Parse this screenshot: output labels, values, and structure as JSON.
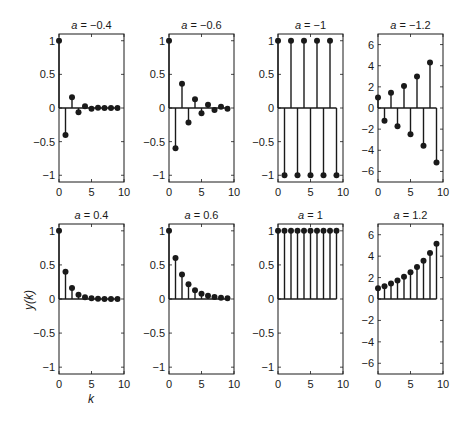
{
  "figure": {
    "ylabel": "y(k)",
    "xlabel": "k"
  },
  "chart_data": [
    {
      "type": "stem",
      "title": "a = −0.4",
      "a": -0.4,
      "x": [
        0,
        1,
        2,
        3,
        4,
        5,
        6,
        7,
        8,
        9
      ],
      "values": [
        1,
        -0.4,
        0.16,
        -0.064,
        0.0256,
        -0.01,
        0.004,
        -0.0016,
        0.0007,
        -0.0003
      ],
      "xlim": [
        0,
        10
      ],
      "ylim": [
        -1.1,
        1.1
      ],
      "xticks": [
        "0",
        "5",
        "10"
      ],
      "yticks": [
        "1",
        "0.5",
        "0",
        "−0.5",
        "−1"
      ]
    },
    {
      "type": "stem",
      "title": "a = −0.6",
      "a": -0.6,
      "x": [
        0,
        1,
        2,
        3,
        4,
        5,
        6,
        7,
        8,
        9
      ],
      "values": [
        1,
        -0.6,
        0.36,
        -0.216,
        0.13,
        -0.078,
        0.047,
        -0.028,
        0.017,
        -0.01
      ],
      "xlim": [
        0,
        10
      ],
      "ylim": [
        -1.1,
        1.1
      ],
      "xticks": [
        "0",
        "5",
        "10"
      ],
      "yticks": [
        "1",
        "0.5",
        "0",
        "−0.5",
        "−1"
      ]
    },
    {
      "type": "stem",
      "title": "a = −1",
      "a": -1,
      "x": [
        0,
        1,
        2,
        3,
        4,
        5,
        6,
        7,
        8,
        9
      ],
      "values": [
        1,
        -1,
        1,
        -1,
        1,
        -1,
        1,
        -1,
        1,
        -1
      ],
      "xlim": [
        0,
        10
      ],
      "ylim": [
        -1.1,
        1.1
      ],
      "xticks": [
        "0",
        "5",
        "10"
      ],
      "yticks": [
        "1",
        "0.5",
        "0",
        "−0.5",
        "−1"
      ]
    },
    {
      "type": "stem",
      "title": "a = −1.2",
      "a": -1.2,
      "x": [
        0,
        1,
        2,
        3,
        4,
        5,
        6,
        7,
        8,
        9
      ],
      "values": [
        1,
        -1.2,
        1.44,
        -1.73,
        2.07,
        -2.49,
        2.99,
        -3.58,
        4.3,
        -5.16
      ],
      "xlim": [
        0,
        10
      ],
      "ylim": [
        -7,
        7
      ],
      "xticks": [
        "0",
        "5",
        "10"
      ],
      "yticks": [
        "6",
        "4",
        "2",
        "0",
        "−2",
        "−4",
        "−6"
      ]
    },
    {
      "type": "stem",
      "title": "a = 0.4",
      "a": 0.4,
      "x": [
        0,
        1,
        2,
        3,
        4,
        5,
        6,
        7,
        8,
        9
      ],
      "values": [
        1,
        0.4,
        0.16,
        0.064,
        0.0256,
        0.01,
        0.004,
        0.0016,
        0.0007,
        0.0003
      ],
      "xlim": [
        0,
        10
      ],
      "ylim": [
        -1.1,
        1.1
      ],
      "xticks": [
        "0",
        "5",
        "10"
      ],
      "yticks": [
        "1",
        "0.5",
        "0",
        "−0.5",
        "−1"
      ]
    },
    {
      "type": "stem",
      "title": "a = 0.6",
      "a": 0.6,
      "x": [
        0,
        1,
        2,
        3,
        4,
        5,
        6,
        7,
        8,
        9
      ],
      "values": [
        1,
        0.6,
        0.36,
        0.216,
        0.13,
        0.078,
        0.047,
        0.028,
        0.017,
        0.01
      ],
      "xlim": [
        0,
        10
      ],
      "ylim": [
        -1.1,
        1.1
      ],
      "xticks": [
        "0",
        "5",
        "10"
      ],
      "yticks": [
        "1",
        "0.5",
        "0",
        "−0.5",
        "−1"
      ]
    },
    {
      "type": "stem",
      "title": "a = 1",
      "a": 1,
      "x": [
        0,
        1,
        2,
        3,
        4,
        5,
        6,
        7,
        8,
        9
      ],
      "values": [
        1,
        1,
        1,
        1,
        1,
        1,
        1,
        1,
        1,
        1
      ],
      "xlim": [
        0,
        10
      ],
      "ylim": [
        -1.1,
        1.1
      ],
      "xticks": [
        "0",
        "5",
        "10"
      ],
      "yticks": [
        "1",
        "0.5",
        "0",
        "−0.5",
        "−1"
      ]
    },
    {
      "type": "stem",
      "title": "a = 1.2",
      "a": 1.2,
      "x": [
        0,
        1,
        2,
        3,
        4,
        5,
        6,
        7,
        8,
        9
      ],
      "values": [
        1,
        1.2,
        1.44,
        1.73,
        2.07,
        2.49,
        2.99,
        3.58,
        4.3,
        5.16
      ],
      "xlim": [
        0,
        10
      ],
      "ylim": [
        -7,
        7
      ],
      "xticks": [
        "0",
        "5",
        "10"
      ],
      "yticks": [
        "6",
        "4",
        "2",
        "0",
        "−2",
        "−4",
        "−6"
      ]
    }
  ]
}
